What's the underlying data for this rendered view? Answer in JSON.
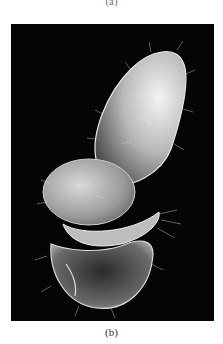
{
  "figure": {
    "panel_a_label": "(a)",
    "panel_b_label": "(b)",
    "panel_b_image": {
      "type": "scanning-electron-micrograph",
      "subject": "ciliated microorganism",
      "background_color": "#050505"
    }
  }
}
